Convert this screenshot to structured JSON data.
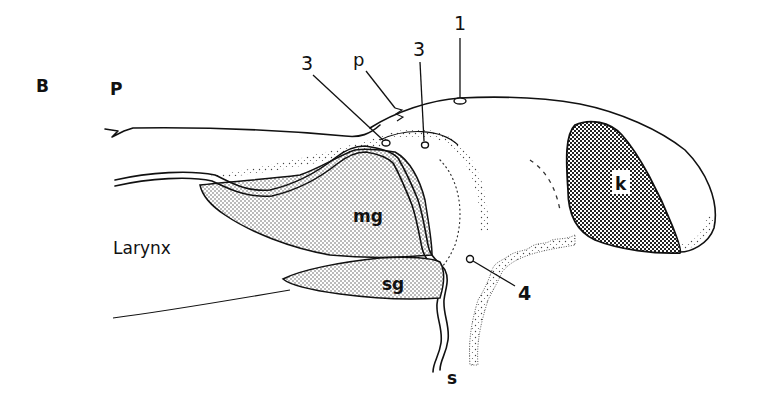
{
  "figure": {
    "panel_label": "B",
    "region_labels": {
      "pharynx": "P",
      "larynx": "Larynx"
    },
    "structure_labels": {
      "parotid_duct": "p",
      "mandibular_gland": "mg",
      "sublingual_gland": "sg",
      "kidney_shape": "k",
      "stalk": "s"
    },
    "number_labels": {
      "pore_1": "1",
      "pore_3a": "3",
      "pore_3b": "3",
      "pore_4": "4"
    },
    "colors": {
      "ink": "#111111",
      "paper": "#ffffff",
      "light_stipple": "#d9d9d9",
      "dark_hatch": "#6e6e6e"
    }
  }
}
